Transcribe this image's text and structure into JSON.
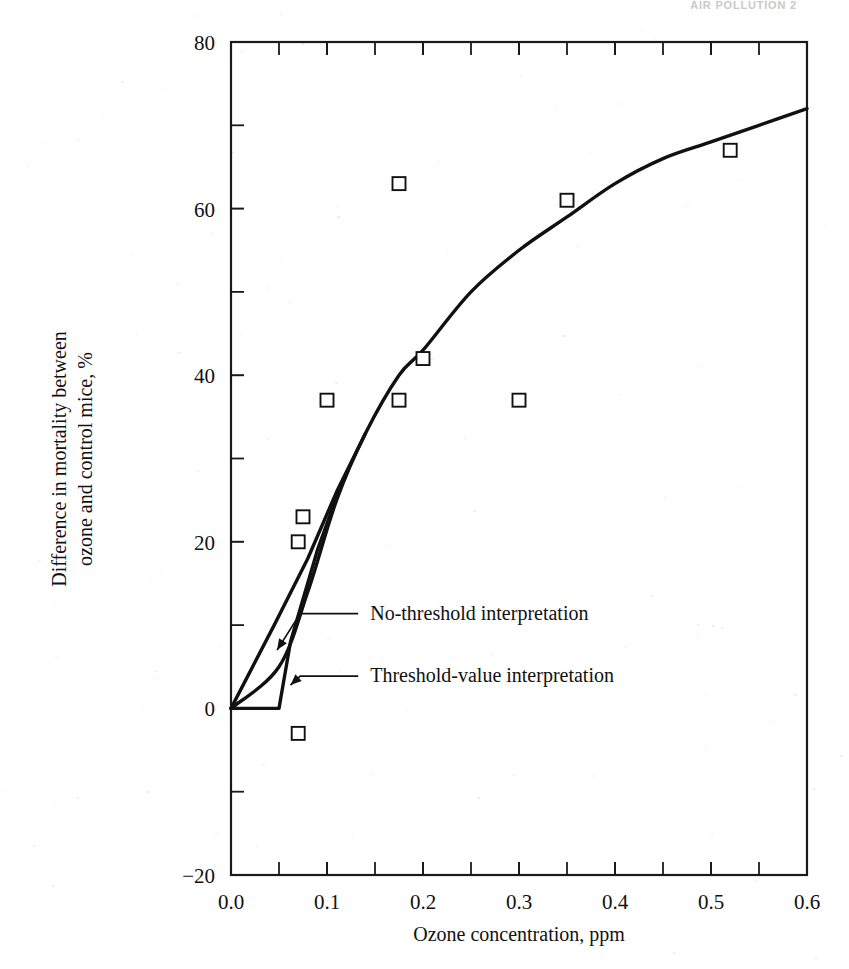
{
  "page": {
    "running_header": "AIR POLLUTION 2",
    "background": "#ffffff",
    "ink": "#111111"
  },
  "chart_data": {
    "type": "scatter",
    "title": "",
    "subtitle": "",
    "xlabel": "Ozone concentration, ppm",
    "ylabel": "Difference in mortality between ozone and control mice, %",
    "ylabel_line1": "Difference in mortality between",
    "ylabel_line2": "ozone and control mice, %",
    "xlim": [
      0.0,
      0.6
    ],
    "ylim": [
      -20,
      80
    ],
    "xticks": [
      0.0,
      0.1,
      0.2,
      0.3,
      0.4,
      0.5,
      0.6
    ],
    "xticklabels": [
      "0.0",
      "0.1",
      "0.2",
      "0.3",
      "0.4",
      "0.5",
      "0.6"
    ],
    "xminorticks": [
      0.05,
      0.15,
      0.25,
      0.35,
      0.45,
      0.55
    ],
    "yticks": [
      -20,
      0,
      20,
      40,
      60,
      80
    ],
    "yticklabels": [
      "-20",
      "0",
      "20",
      "40",
      "60",
      "80"
    ],
    "yminorticks": [
      -10,
      10,
      30,
      50,
      70
    ],
    "grid": false,
    "legend": "none",
    "frame": "box",
    "series": [
      {
        "name": "Observed mortality difference",
        "type": "scatter",
        "marker": "open-square",
        "points": [
          {
            "x": 0.07,
            "y": -3
          },
          {
            "x": 0.07,
            "y": 20
          },
          {
            "x": 0.075,
            "y": 23
          },
          {
            "x": 0.1,
            "y": 37
          },
          {
            "x": 0.175,
            "y": 63
          },
          {
            "x": 0.175,
            "y": 37
          },
          {
            "x": 0.2,
            "y": 42
          },
          {
            "x": 0.3,
            "y": 37
          },
          {
            "x": 0.35,
            "y": 61
          },
          {
            "x": 0.52,
            "y": 67
          }
        ]
      },
      {
        "name": "No-threshold interpretation",
        "type": "line",
        "points": [
          {
            "x": 0.0,
            "y": 0
          },
          {
            "x": 0.045,
            "y": 10
          },
          {
            "x": 0.08,
            "y": 18
          },
          {
            "x": 0.11,
            "y": 26
          },
          {
            "x": 0.14,
            "y": 33
          }
        ]
      },
      {
        "name": "Threshold-value interpretation",
        "type": "line",
        "points": [
          {
            "x": 0.0,
            "y": 0
          },
          {
            "x": 0.05,
            "y": 0
          },
          {
            "x": 0.062,
            "y": 8
          },
          {
            "x": 0.09,
            "y": 19
          },
          {
            "x": 0.115,
            "y": 27
          }
        ]
      },
      {
        "name": "Fitted dose-response curve",
        "type": "line",
        "points": [
          {
            "x": 0.0,
            "y": 0
          },
          {
            "x": 0.05,
            "y": 5
          },
          {
            "x": 0.08,
            "y": 14
          },
          {
            "x": 0.11,
            "y": 25
          },
          {
            "x": 0.14,
            "y": 33
          },
          {
            "x": 0.175,
            "y": 40
          },
          {
            "x": 0.2,
            "y": 43
          },
          {
            "x": 0.25,
            "y": 50
          },
          {
            "x": 0.3,
            "y": 55
          },
          {
            "x": 0.35,
            "y": 59
          },
          {
            "x": 0.4,
            "y": 63
          },
          {
            "x": 0.45,
            "y": 66
          },
          {
            "x": 0.5,
            "y": 68
          },
          {
            "x": 0.55,
            "y": 70
          },
          {
            "x": 0.6,
            "y": 72
          }
        ]
      }
    ],
    "annotations": [
      {
        "id": "no-threshold",
        "label": "No-threshold interpretation",
        "text_x": 0.145,
        "text_y": 11.5,
        "target_x": 0.048,
        "target_y": 7.0
      },
      {
        "id": "threshold-value",
        "label": "Threshold-value interpretation",
        "text_x": 0.145,
        "text_y": 4.0,
        "target_x": 0.062,
        "target_y": 2.8
      }
    ]
  }
}
